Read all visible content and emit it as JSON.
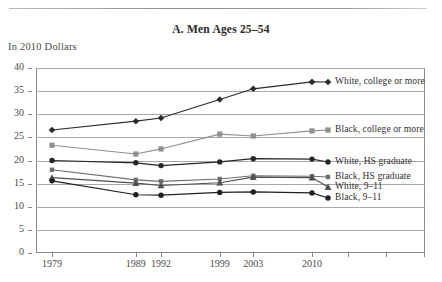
{
  "figure": {
    "panel_title": "A. Men Ages 25–54",
    "units_label": "In 2010 Dollars"
  },
  "chart_data": {
    "type": "line",
    "title": "A. Men Ages 25–54",
    "subtitle": "In 2010 Dollars",
    "xlabel": "",
    "ylabel": "",
    "ylim": [
      0,
      40
    ],
    "ytick_step": 5,
    "yticks": [
      0,
      5,
      10,
      15,
      20,
      25,
      30,
      35,
      40
    ],
    "ytick_labels": [
      "0",
      "5",
      "10",
      "15",
      "20",
      "25",
      "30",
      "35",
      "40"
    ],
    "grid": true,
    "grid_axis": "y",
    "legend_position": "right-inline-labels",
    "x": [
      1979,
      1989,
      1992,
      1999,
      2003,
      2010
    ],
    "xtick_labels": [
      "1979",
      "1989",
      "1992",
      "1999",
      "2003",
      "2010"
    ],
    "x_scale": "time",
    "series": [
      {
        "name": "White, college or more",
        "marker": "diamond",
        "color": "#2b2b2b",
        "values": [
          26.6,
          28.5,
          29.2,
          33.2,
          35.5,
          37.0
        ]
      },
      {
        "name": "Black, college or more",
        "marker": "square",
        "color": "#8f8f8f",
        "values": [
          23.3,
          21.4,
          22.5,
          25.7,
          25.3,
          26.4
        ]
      },
      {
        "name": "White, HS graduate",
        "marker": "circle",
        "color": "#262626",
        "values": [
          20.0,
          19.5,
          18.9,
          19.7,
          20.4,
          20.3
        ]
      },
      {
        "name": "Black, HS graduate",
        "marker": "square-small",
        "color": "#6e6e6e",
        "values": [
          18.0,
          15.8,
          15.5,
          16.0,
          16.7,
          16.6
        ]
      },
      {
        "name": "White, 9–11",
        "marker": "triangle",
        "color": "#4f4f4f",
        "values": [
          16.3,
          15.1,
          14.6,
          15.2,
          16.4,
          16.3
        ]
      },
      {
        "name": "Black, 9–11",
        "marker": "circle",
        "color": "#1f1f1f",
        "values": [
          15.6,
          12.6,
          12.5,
          13.1,
          13.2,
          13.0
        ]
      }
    ]
  }
}
